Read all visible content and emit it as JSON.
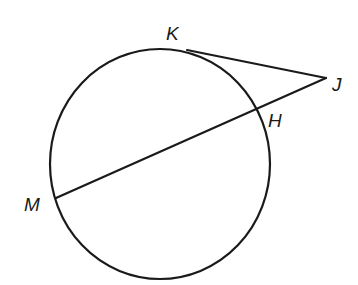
{
  "diagram": {
    "type": "geometry-circle-tangent-secant",
    "stroke_color": "#1a1a1a",
    "background": "#ffffff",
    "circle": {
      "cx": 160,
      "cy": 164,
      "rx": 110,
      "ry": 115
    },
    "points": {
      "K": {
        "label": "K",
        "x": 187,
        "y": 50,
        "label_x": 166,
        "label_y": 40
      },
      "J": {
        "label": "J",
        "x": 326,
        "y": 78,
        "label_x": 332,
        "label_y": 91
      },
      "H": {
        "label": "H",
        "x": 257,
        "y": 110,
        "label_x": 268,
        "label_y": 127
      },
      "M": {
        "label": "M",
        "x": 56,
        "y": 198,
        "label_x": 24,
        "label_y": 211
      }
    },
    "segments": [
      {
        "name": "tangent-KJ",
        "from": "K",
        "to": "J"
      },
      {
        "name": "secant-MJ",
        "from": "M",
        "to": "J"
      }
    ]
  }
}
